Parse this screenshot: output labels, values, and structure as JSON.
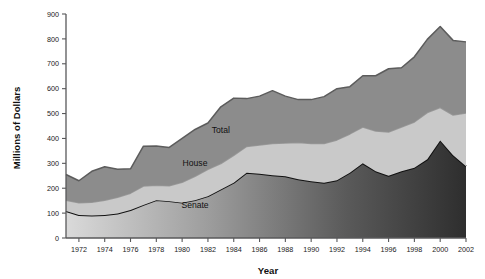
{
  "chart_data": {
    "type": "area",
    "stacked": true,
    "title": "",
    "xlabel": "Year",
    "ylabel": "Millions of Dollars",
    "xlim": [
      1971,
      2002
    ],
    "ylim": [
      0,
      900
    ],
    "grid": false,
    "legend_position": "inline-annotations",
    "x": [
      1971,
      1972,
      1973,
      1974,
      1975,
      1976,
      1977,
      1978,
      1979,
      1980,
      1981,
      1982,
      1983,
      1984,
      1985,
      1986,
      1987,
      1988,
      1989,
      1990,
      1991,
      1992,
      1993,
      1994,
      1995,
      1996,
      1997,
      1998,
      1999,
      2000,
      2001,
      2002
    ],
    "xticks": [
      1972,
      1974,
      1976,
      1978,
      1980,
      1982,
      1984,
      1986,
      1988,
      1990,
      1992,
      1994,
      1996,
      1998,
      2000,
      2002
    ],
    "yticks": [
      0,
      100,
      200,
      300,
      400,
      500,
      600,
      700,
      800,
      900
    ],
    "series": [
      {
        "name": "Senate",
        "label": "Senate",
        "color": "#6e6e6e",
        "line_color": "#111111",
        "gradient": [
          "#d8d8d8",
          "#303030"
        ],
        "values": [
          108,
          92,
          90,
          92,
          98,
          112,
          133,
          152,
          148,
          142,
          152,
          168,
          195,
          222,
          262,
          258,
          252,
          248,
          236,
          228,
          222,
          232,
          262,
          300,
          268,
          250,
          268,
          282,
          316,
          392,
          332,
          288
        ]
      },
      {
        "name": "House",
        "label": "House",
        "color": "#c9c9c9",
        "line_color": "#9a9a9a",
        "values": [
          44,
          50,
          54,
          60,
          66,
          68,
          76,
          60,
          62,
          82,
          96,
          108,
          104,
          110,
          106,
          116,
          128,
          134,
          148,
          152,
          158,
          162,
          156,
          146,
          162,
          176,
          178,
          184,
          188,
          132,
          162,
          214
        ]
      },
      {
        "name": "Total",
        "label": "Total",
        "color": "#8c8c8c",
        "line_color": "#5c5c5c",
        "values": [
          103,
          88,
          124,
          134,
          112,
          98,
          160,
          158,
          154,
          176,
          188,
          186,
          228,
          230,
          192,
          196,
          212,
          188,
          172,
          176,
          188,
          206,
          190,
          206,
          222,
          254,
          238,
          262,
          294,
          326,
          300,
          286
        ]
      }
    ],
    "cumulative_totals": [
      255,
      230,
      268,
      286,
      276,
      278,
      369,
      370,
      364,
      400,
      436,
      462,
      527,
      562,
      560,
      570,
      592,
      570,
      556,
      556,
      568,
      600,
      608,
      652,
      652,
      680,
      684,
      728,
      798,
      850,
      794,
      788
    ],
    "annotations": [
      {
        "text": "Total",
        "x": 1983,
        "y": 420
      },
      {
        "text": "House",
        "x": 1981,
        "y": 288
      },
      {
        "text": "Senate",
        "x": 1981,
        "y": 122
      }
    ]
  }
}
